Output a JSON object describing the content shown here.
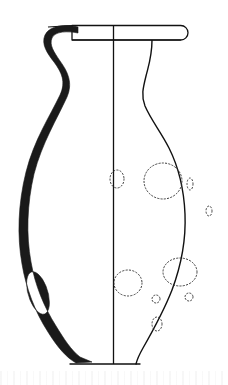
{
  "figure": {
    "title": "Ceramic vessel profile drawing",
    "object_type": "one-handled jug / amphoriskos",
    "view": "half-section profile drawing",
    "canvas": {
      "width": 228,
      "height": 385
    },
    "colors": {
      "background": "#ffffff",
      "outline": "#111111",
      "handle_fill": "#1a1a1a",
      "stipple": "#2b2b2b",
      "noise": "#8d8d8d"
    },
    "line_weights": {
      "profile_outline": 1.4,
      "section_axis": 1.3,
      "rim_detail": 1.2,
      "stipple_dot": 0.9
    }
  },
  "drawing": {
    "axis": {
      "label": "vertical-section-axis",
      "x": 113.5,
      "y_top": 25.5,
      "y_bottom": 364
    },
    "rim": {
      "label": "flat-disc-rim",
      "left_x": 72,
      "right_x": 188,
      "top_y": 25.5,
      "bottom_y": 40,
      "rounded_end": true,
      "tick_line_left_x": 48
    },
    "right_profile_path": "M 152,40 C 152,56 149,64 146,76 C 143,88 141,96 145,106 C 151,120 161,132 169,148 C 179,168 184,190 185,214 C 186,238 181,266 172,290 C 163,313 151,334 143,348 C 139,355 137,360 136,364",
    "base": {
      "label": "flat-base",
      "left_x": 70,
      "right_x": 140,
      "y": 364,
      "heel_right_x": 152,
      "heel_y": 352
    },
    "handle": {
      "label": "loop-handle-filled-black",
      "fill": "#1a1a1a",
      "top_attach": {
        "x": 72,
        "y": 29
      },
      "apex": {
        "x": 46,
        "y": 34
      },
      "outer_path": "M 78,27 C 66,24 50,25 45,35 C 41,44 47,53 54,62 C 62,73 66,82 60,95 C 50,116 34,140 26,172 C 18,204 17,236 22,264 C 26,288 35,312 48,332 C 58,348 66,357 76,363",
      "inner_path": "M 78,33 C 68,31 55,31 52,38 C 49,45 54,52 60,61 C 68,72 73,83 67,97 C 57,119 42,143 34,174 C 27,204 26,235 31,262 C 35,285 44,307 56,326 C 64,339 71,350 80,357",
      "eye": {
        "label": "handle-aperture",
        "cx": 38,
        "cy": 293,
        "rx": 8.5,
        "ry": 19,
        "rotation": -17
      },
      "lower_terminal": {
        "x": 92,
        "y": 362
      }
    },
    "surface_marks": [
      {
        "name": "chip-mark-center-small",
        "type": "stipple-arc",
        "cx": 117,
        "cy": 179,
        "rx": 7,
        "ry": 9,
        "dash": "1.3 2.1"
      },
      {
        "name": "chip-mark-large-upper",
        "type": "stipple-circle",
        "cx": 163,
        "cy": 181,
        "rx": 19,
        "ry": 18,
        "dash": "1.3 2.0"
      },
      {
        "name": "chip-mark-sliver-upper-right",
        "type": "stipple-arc",
        "cx": 190,
        "cy": 184,
        "rx": 3,
        "ry": 6,
        "dash": "1.2 2.2"
      },
      {
        "name": "chip-mark-edge-right",
        "type": "stipple-arc",
        "cx": 209,
        "cy": 211,
        "rx": 3,
        "ry": 5,
        "dash": "1.2 2.2"
      },
      {
        "name": "chip-mark-lower-left",
        "type": "stipple-circle",
        "cx": 128,
        "cy": 283,
        "rx": 14,
        "ry": 13,
        "dash": "1.3 2.1"
      },
      {
        "name": "chip-mark-lower-right",
        "type": "stipple-circle",
        "cx": 180,
        "cy": 272,
        "rx": 17,
        "ry": 14,
        "dash": "1.3 2.0"
      },
      {
        "name": "chip-mark-dot-small",
        "type": "stipple-circle",
        "cx": 156,
        "cy": 299,
        "rx": 4,
        "ry": 4,
        "dash": "1.2 2.0"
      },
      {
        "name": "chip-mark-dot-edge",
        "type": "stipple-arc",
        "cx": 189,
        "cy": 297,
        "rx": 4,
        "ry": 4,
        "dash": "1.2 2.0"
      },
      {
        "name": "chip-mark-oval-bottom",
        "type": "stipple-circle",
        "cx": 157,
        "cy": 324,
        "rx": 5,
        "ry": 7,
        "dash": "1.2 2.1"
      }
    ]
  }
}
